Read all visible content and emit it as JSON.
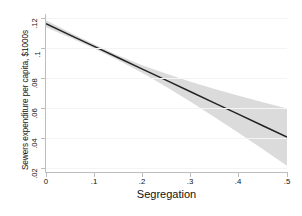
{
  "chart_data": {
    "type": "line",
    "title": "",
    "subtitle": "",
    "xlabel": "Segregation",
    "ylabel": "Sewers expenditure per capita, $1000s",
    "xlim": [
      0,
      0.5
    ],
    "ylim": [
      0.012,
      0.125
    ],
    "xticks": [
      0,
      0.1,
      0.2,
      0.3,
      0.4,
      0.5
    ],
    "xticklabels": [
      "0",
      ".1",
      ".2",
      ".3",
      ".4",
      ".5"
    ],
    "yticks": [
      0.02,
      0.04,
      0.06,
      0.08,
      0.1,
      0.12
    ],
    "yticklabels": [
      ".02",
      ".04",
      ".06",
      ".08",
      ".1",
      ".12"
    ],
    "grid": "faint-horizontal",
    "legend": "none",
    "series": [
      {
        "name": "Predicted sewers expenditure",
        "kind": "line",
        "color": "#222222",
        "x": [
          0,
          0.05,
          0.1,
          0.15,
          0.2,
          0.25,
          0.3,
          0.35,
          0.4,
          0.45,
          0.5
        ],
        "values": [
          0.118,
          0.1099,
          0.1018,
          0.0937,
          0.0856,
          0.0775,
          0.0694,
          0.0613,
          0.0532,
          0.0451,
          0.037
        ]
      },
      {
        "name": "95% confidence interval",
        "kind": "band",
        "color": "#d9d9d9",
        "x": [
          0,
          0.05,
          0.1,
          0.15,
          0.2,
          0.25,
          0.3,
          0.35,
          0.4,
          0.45,
          0.5
        ],
        "upper": [
          0.1205,
          0.1118,
          0.1033,
          0.0954,
          0.0884,
          0.0822,
          0.0766,
          0.0714,
          0.0665,
          0.0619,
          0.0575
        ],
        "lower": [
          0.1155,
          0.108,
          0.1003,
          0.092,
          0.0828,
          0.0728,
          0.0622,
          0.0512,
          0.0399,
          0.0283,
          0.0165
        ]
      }
    ]
  },
  "axes": {
    "axis_color": "#bdbdbd",
    "grid_color": "#f4f4f4",
    "background": "#ffffff"
  }
}
